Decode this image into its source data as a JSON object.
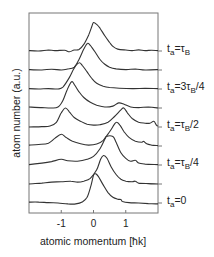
{
  "chart_data": {
    "type": "line",
    "title": "",
    "xlabel": "atomic momentum [ħk]",
    "ylabel": "atom number (a.u.)",
    "xlim": [
      -2,
      2
    ],
    "x_ticks": [
      -1,
      0,
      1
    ],
    "x_tick_labels": [
      "-1",
      "0",
      "1"
    ],
    "y_ticks_shown": false,
    "offset_spacing": 1,
    "grid": false,
    "legend_placement": "right-of-plot, inline per curve",
    "series": [
      {
        "name": "curve-1",
        "offset": 8,
        "label": {
          "main": "t",
          "sub": "a",
          "mid": "=τ",
          "sub2": "B",
          "tail": ""
        },
        "points": [
          [
            -2,
            0.02
          ],
          [
            -1.7,
            0
          ],
          [
            -1.4,
            0.05
          ],
          [
            -1.2,
            0.02
          ],
          [
            -0.9,
            0.04
          ],
          [
            -0.75,
            -0.04
          ],
          [
            -0.6,
            0.05
          ],
          [
            -0.45,
            0.08
          ],
          [
            -0.3,
            0.35
          ],
          [
            -0.15,
            0.85
          ],
          [
            -0.05,
            1.3
          ],
          [
            0.0,
            1.5
          ],
          [
            0.1,
            1.4
          ],
          [
            0.2,
            1.2
          ],
          [
            0.35,
            0.8
          ],
          [
            0.5,
            0.45
          ],
          [
            0.6,
            0.25
          ],
          [
            0.75,
            0.1
          ],
          [
            1.0,
            0.05
          ],
          [
            1.2,
            0.02
          ],
          [
            1.4,
            0.06
          ],
          [
            1.6,
            0.02
          ],
          [
            1.8,
            0.04
          ],
          [
            2,
            0.02
          ]
        ]
      },
      {
        "name": "curve-2",
        "offset": 7,
        "label": null,
        "points": [
          [
            -2,
            0.02
          ],
          [
            -1.6,
            0.0
          ],
          [
            -1.3,
            0.04
          ],
          [
            -1.0,
            0.0
          ],
          [
            -0.8,
            0.05
          ],
          [
            -0.6,
            0.15
          ],
          [
            -0.45,
            0.55
          ],
          [
            -0.3,
            1.1
          ],
          [
            -0.19,
            1.4
          ],
          [
            -0.1,
            1.3
          ],
          [
            0.05,
            0.95
          ],
          [
            0.2,
            0.55
          ],
          [
            0.35,
            0.3
          ],
          [
            0.5,
            0.15
          ],
          [
            0.7,
            0.06
          ],
          [
            1.0,
            0.02
          ],
          [
            1.3,
            0.05
          ],
          [
            1.6,
            0.0
          ],
          [
            2,
            0.02
          ]
        ]
      },
      {
        "name": "curve-3",
        "offset": 6,
        "label": {
          "main": "t",
          "sub": "a",
          "mid": "=3τ",
          "sub2": "B",
          "tail": "/4"
        },
        "points": [
          [
            -2,
            0.02
          ],
          [
            -1.7,
            0.0
          ],
          [
            -1.4,
            0.02
          ],
          [
            -1.1,
            0.0
          ],
          [
            -0.95,
            0.1
          ],
          [
            -0.75,
            0.6
          ],
          [
            -0.6,
            1.1
          ],
          [
            -0.45,
            1.38
          ],
          [
            -0.35,
            1.25
          ],
          [
            -0.2,
            0.9
          ],
          [
            -0.05,
            0.55
          ],
          [
            0.1,
            0.3
          ],
          [
            0.3,
            0.15
          ],
          [
            0.5,
            0.08
          ],
          [
            0.8,
            0.04
          ],
          [
            1.2,
            0.02
          ],
          [
            1.6,
            0.03
          ],
          [
            2,
            0.02
          ]
        ]
      },
      {
        "name": "curve-4",
        "offset": 5,
        "label": null,
        "points": [
          [
            -2,
            0.05
          ],
          [
            -1.6,
            0.02
          ],
          [
            -1.3,
            0.0
          ],
          [
            -1.1,
            0.05
          ],
          [
            -0.95,
            0.4
          ],
          [
            -0.82,
            0.95
          ],
          [
            -0.68,
            1.38
          ],
          [
            -0.58,
            1.2
          ],
          [
            -0.45,
            0.85
          ],
          [
            -0.3,
            0.55
          ],
          [
            -0.1,
            0.3
          ],
          [
            0.1,
            0.15
          ],
          [
            0.35,
            0.05
          ],
          [
            0.6,
            0.1
          ],
          [
            0.78,
            0.27
          ],
          [
            0.95,
            0.2
          ],
          [
            1.15,
            0.05
          ],
          [
            1.4,
            0.02
          ],
          [
            1.7,
            0.05
          ],
          [
            2,
            0.0
          ]
        ]
      },
      {
        "name": "curve-5",
        "offset": 4,
        "label": {
          "main": "t",
          "sub": "a",
          "mid": "=τ",
          "sub2": "B",
          "tail": "/2"
        },
        "points": [
          [
            -2,
            0.0
          ],
          [
            -1.6,
            0.02
          ],
          [
            -1.35,
            0.05
          ],
          [
            -1.15,
            0.25
          ],
          [
            -1.0,
            0.75
          ],
          [
            -0.87,
            1.0
          ],
          [
            -0.75,
            0.8
          ],
          [
            -0.6,
            0.5
          ],
          [
            -0.4,
            0.3
          ],
          [
            -0.2,
            0.15
          ],
          [
            0.0,
            0.1
          ],
          [
            0.2,
            0.12
          ],
          [
            0.45,
            0.25
          ],
          [
            0.65,
            0.55
          ],
          [
            0.85,
            0.9
          ],
          [
            0.94,
            1.0
          ],
          [
            1.05,
            0.75
          ],
          [
            1.2,
            0.45
          ],
          [
            1.4,
            0.25
          ],
          [
            1.6,
            0.2
          ],
          [
            1.75,
            0.2
          ],
          [
            1.87,
            0.3
          ],
          [
            1.95,
            0.1
          ],
          [
            2,
            0.05
          ]
        ]
      },
      {
        "name": "curve-6",
        "offset": 3,
        "label": null,
        "points": [
          [
            -2,
            0.05
          ],
          [
            -1.7,
            0.08
          ],
          [
            -1.4,
            0.15
          ],
          [
            -1.2,
            0.4
          ],
          [
            -1.0,
            0.62
          ],
          [
            -0.85,
            0.45
          ],
          [
            -0.65,
            0.25
          ],
          [
            -0.4,
            0.12
          ],
          [
            -0.15,
            0.05
          ],
          [
            0.1,
            0.1
          ],
          [
            0.3,
            0.3
          ],
          [
            0.5,
            0.75
          ],
          [
            0.65,
            1.15
          ],
          [
            0.72,
            1.25
          ],
          [
            0.82,
            1.1
          ],
          [
            0.95,
            0.75
          ],
          [
            1.1,
            0.45
          ],
          [
            1.3,
            0.25
          ],
          [
            1.5,
            0.2
          ],
          [
            1.55,
            0.25
          ],
          [
            1.65,
            0.12
          ],
          [
            1.8,
            0.05
          ],
          [
            2,
            0.02
          ]
        ]
      },
      {
        "name": "curve-7",
        "offset": 2,
        "label": {
          "main": "t",
          "sub": "a",
          "mid": "=τ",
          "sub2": "B",
          "tail": "/4"
        },
        "points": [
          [
            -2,
            0.02
          ],
          [
            -1.6,
            0.1
          ],
          [
            -1.3,
            0.18
          ],
          [
            -1.0,
            0.3
          ],
          [
            -0.8,
            0.22
          ],
          [
            -0.5,
            0.2
          ],
          [
            -0.2,
            0.3
          ],
          [
            0.0,
            0.45
          ],
          [
            0.2,
            0.85
          ],
          [
            0.35,
            1.35
          ],
          [
            0.4,
            1.5
          ],
          [
            0.6,
            1.5
          ],
          [
            0.7,
            1.2
          ],
          [
            0.85,
            0.65
          ],
          [
            1.0,
            0.35
          ],
          [
            1.15,
            0.2
          ],
          [
            1.3,
            0.25
          ],
          [
            1.4,
            0.1
          ],
          [
            1.6,
            0.05
          ],
          [
            2,
            0.02
          ]
        ]
      },
      {
        "name": "curve-8",
        "offset": 1,
        "label": null,
        "points": [
          [
            -2,
            0.0
          ],
          [
            -1.6,
            0.05
          ],
          [
            -1.3,
            0.1
          ],
          [
            -1.0,
            0.12
          ],
          [
            -0.7,
            0.15
          ],
          [
            -0.5,
            0.1
          ],
          [
            -0.3,
            0.15
          ],
          [
            -0.1,
            0.3
          ],
          [
            0.1,
            0.75
          ],
          [
            0.22,
            1.3
          ],
          [
            0.31,
            1.5
          ],
          [
            0.42,
            1.35
          ],
          [
            0.55,
            0.9
          ],
          [
            0.7,
            0.5
          ],
          [
            0.85,
            0.25
          ],
          [
            1.0,
            0.15
          ],
          [
            1.2,
            0.12
          ],
          [
            1.3,
            0.15
          ],
          [
            1.4,
            0.05
          ],
          [
            1.7,
            0.02
          ],
          [
            2,
            0.0
          ]
        ]
      },
      {
        "name": "curve-9",
        "offset": 0,
        "label": {
          "main": "t",
          "sub": "a",
          "mid": "=0",
          "sub2": "",
          "tail": ""
        },
        "points": [
          [
            -2,
            0.05
          ],
          [
            -1.7,
            0.05
          ],
          [
            -1.4,
            0.02
          ],
          [
            -1.1,
            0.0
          ],
          [
            -0.8,
            -0.05
          ],
          [
            -0.55,
            -0.05
          ],
          [
            -0.35,
            0.05
          ],
          [
            -0.2,
            0.3
          ],
          [
            -0.08,
            0.9
          ],
          [
            0.0,
            1.45
          ],
          [
            0.06,
            1.55
          ],
          [
            0.15,
            1.4
          ],
          [
            0.3,
            0.95
          ],
          [
            0.45,
            0.55
          ],
          [
            0.6,
            0.3
          ],
          [
            0.75,
            0.2
          ],
          [
            0.85,
            0.18
          ],
          [
            0.9,
            0.08
          ],
          [
            1.1,
            0.02
          ],
          [
            1.4,
            0.0
          ],
          [
            1.7,
            -0.03
          ],
          [
            2,
            -0.05
          ]
        ]
      }
    ]
  }
}
